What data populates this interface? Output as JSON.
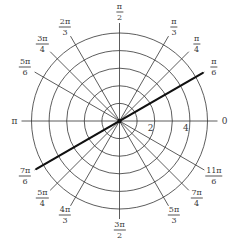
{
  "chart_data": {
    "type": "polar",
    "title": "",
    "center_px": [
      119.5,
      121
    ],
    "px_per_unit": 17.6,
    "radial_grid": [
      1,
      2,
      3,
      4,
      5
    ],
    "radial_tick_labels": [
      {
        "r": 2,
        "text": "2"
      },
      {
        "r": 4,
        "text": "4"
      }
    ],
    "angular_ticks": [
      {
        "angle_deg": 0,
        "num": "0",
        "den": ""
      },
      {
        "angle_deg": 30,
        "num": "π",
        "den": "6"
      },
      {
        "angle_deg": 45,
        "num": "π",
        "den": "4"
      },
      {
        "angle_deg": 60,
        "num": "π",
        "den": "3"
      },
      {
        "angle_deg": 90,
        "num": "π",
        "den": "2"
      },
      {
        "angle_deg": 120,
        "num": "2π",
        "den": "3"
      },
      {
        "angle_deg": 135,
        "num": "3π",
        "den": "4"
      },
      {
        "angle_deg": 150,
        "num": "5π",
        "den": "6"
      },
      {
        "angle_deg": 180,
        "num": "π",
        "den": ""
      },
      {
        "angle_deg": 210,
        "num": "7π",
        "den": "6"
      },
      {
        "angle_deg": 225,
        "num": "5π",
        "den": "4"
      },
      {
        "angle_deg": 240,
        "num": "4π",
        "den": "3"
      },
      {
        "angle_deg": 270,
        "num": "3π",
        "den": "2"
      },
      {
        "angle_deg": 300,
        "num": "5π",
        "den": "3"
      },
      {
        "angle_deg": 315,
        "num": "7π",
        "den": "4"
      },
      {
        "angle_deg": 330,
        "num": "11π",
        "den": "6"
      }
    ],
    "series": [
      {
        "name": "line θ = π/6",
        "type": "line",
        "theta": "π/6",
        "points": [
          {
            "r": -5.5,
            "theta_deg": 30
          },
          {
            "r": 5.5,
            "theta_deg": 30
          }
        ],
        "color": "#111111",
        "stroke_width": 2.2
      }
    ],
    "grid": true,
    "legend": null
  },
  "style": {
    "grid_color": "#333333",
    "line_color": "#111111",
    "label_color": "#3a3a3a"
  }
}
